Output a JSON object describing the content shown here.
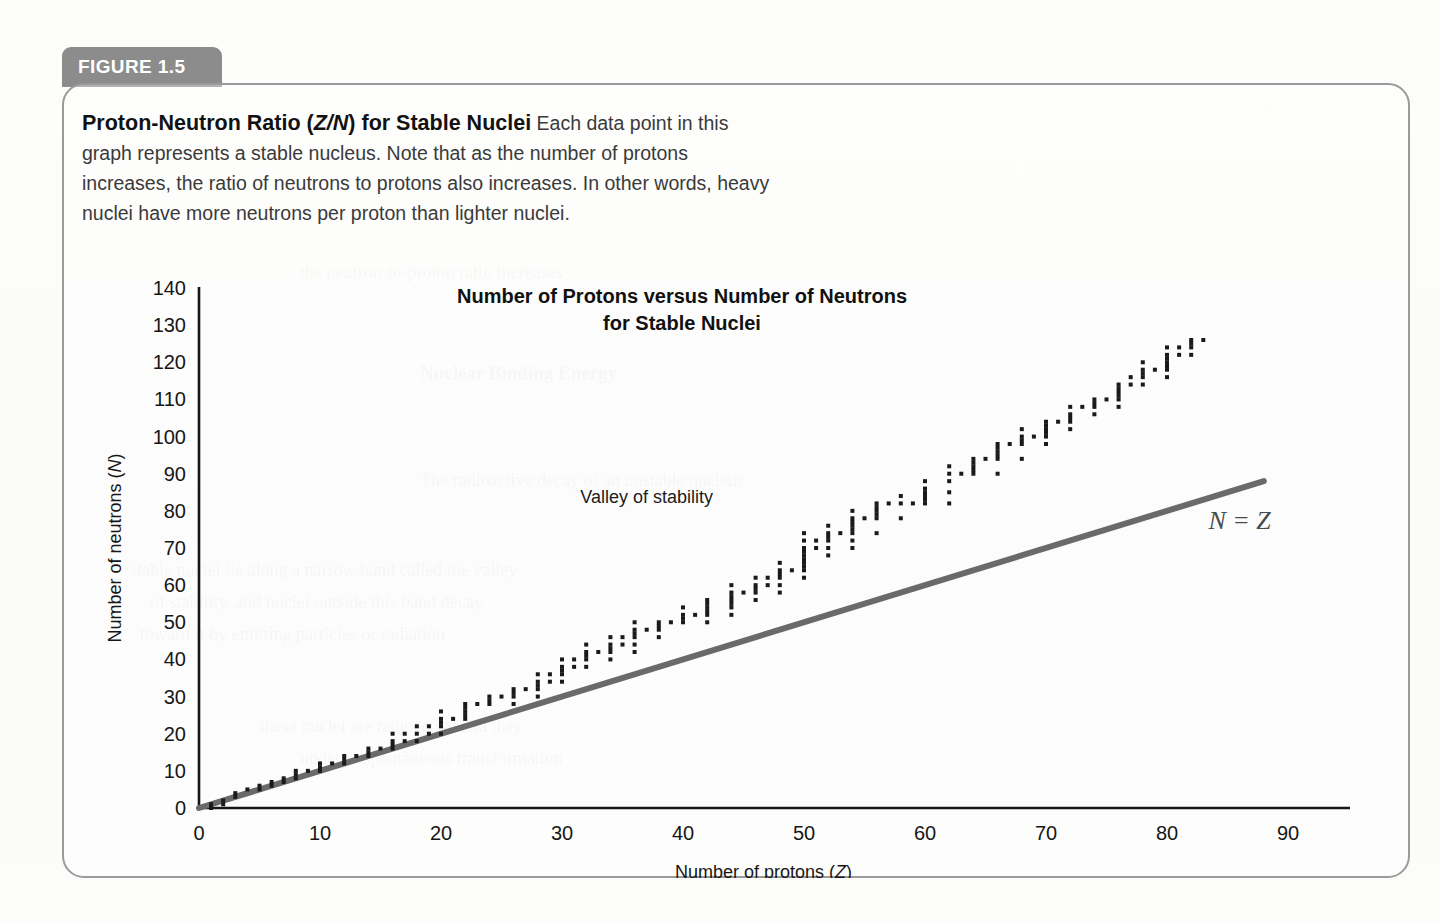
{
  "figure": {
    "tab_label": "FIGURE 1.5",
    "caption_title": "Proton-Neutron Ratio (Z/N) for Stable Nuclei",
    "caption_title_italic_part": "Z/N",
    "caption_body": "Each data point in this graph represents a stable nucleus. Note that as the number of protons increases, the ratio of neutrons to protons also increases. In other words, heavy nuclei have more neutrons per proton than lighter nuclei."
  },
  "colors": {
    "tab_background": "#8c8c8c",
    "tab_text": "#ffffff",
    "box_border": "#9a9a9a",
    "axis": "#161616",
    "data_point": "#1a1a1a",
    "nz_line": "#6a6a6a",
    "page_background": "#fcfcfb"
  },
  "chart_data": {
    "type": "scatter",
    "title": "Number of Protons versus Number of Neutrons for Stable Nuclei",
    "title_line1": "Number of Protons versus Number of Neutrons",
    "title_line2": "for Stable Nuclei",
    "xlabel": "Number of protons (Z)",
    "xlabel_text": "Number of protons (",
    "xlabel_italic": "Z",
    "ylabel": "Number of neutrons (N)",
    "ylabel_text": "Number of neutrons (",
    "ylabel_italic": "N",
    "xlim": [
      0,
      90
    ],
    "ylim": [
      0,
      140
    ],
    "xticks": [
      0,
      10,
      20,
      30,
      40,
      50,
      60,
      70,
      80,
      90
    ],
    "yticks": [
      0,
      10,
      20,
      30,
      40,
      50,
      60,
      70,
      80,
      90,
      100,
      110,
      120,
      130,
      140
    ],
    "grid": false,
    "legend": false,
    "annotations": [
      {
        "text": "Valley of stability",
        "x": 37,
        "y": 82
      },
      {
        "text": "N = Z",
        "x": 86,
        "y": 75
      }
    ],
    "reference_line": {
      "label": "N = Z",
      "equation": "N = Z",
      "from": [
        0,
        0
      ],
      "to": [
        88,
        88
      ],
      "color": "#6a6a6a",
      "width_px": 6
    },
    "series": [
      {
        "name": "Stable nuclei",
        "marker": "square",
        "marker_size_px": 4,
        "color": "#1a1a1a",
        "points_by_Z": [
          {
            "Z": 1,
            "N": [
              0,
              1
            ]
          },
          {
            "Z": 2,
            "N": [
              1,
              2
            ]
          },
          {
            "Z": 3,
            "N": [
              3,
              4
            ]
          },
          {
            "Z": 4,
            "N": [
              5
            ]
          },
          {
            "Z": 5,
            "N": [
              5,
              6
            ]
          },
          {
            "Z": 6,
            "N": [
              6,
              7
            ]
          },
          {
            "Z": 7,
            "N": [
              7,
              8
            ]
          },
          {
            "Z": 8,
            "N": [
              8,
              9,
              10
            ]
          },
          {
            "Z": 9,
            "N": [
              10
            ]
          },
          {
            "Z": 10,
            "N": [
              10,
              11,
              12
            ]
          },
          {
            "Z": 11,
            "N": [
              12
            ]
          },
          {
            "Z": 12,
            "N": [
              12,
              13,
              14
            ]
          },
          {
            "Z": 13,
            "N": [
              14
            ]
          },
          {
            "Z": 14,
            "N": [
              14,
              15,
              16
            ]
          },
          {
            "Z": 15,
            "N": [
              16
            ]
          },
          {
            "Z": 16,
            "N": [
              16,
              17,
              18,
              20
            ]
          },
          {
            "Z": 17,
            "N": [
              18,
              20
            ]
          },
          {
            "Z": 18,
            "N": [
              18,
              20,
              22
            ]
          },
          {
            "Z": 19,
            "N": [
              20,
              22
            ]
          },
          {
            "Z": 20,
            "N": [
              20,
              22,
              23,
              24,
              26
            ]
          },
          {
            "Z": 21,
            "N": [
              24
            ]
          },
          {
            "Z": 22,
            "N": [
              24,
              25,
              26,
              27,
              28
            ]
          },
          {
            "Z": 23,
            "N": [
              28
            ]
          },
          {
            "Z": 24,
            "N": [
              28,
              29,
              30
            ]
          },
          {
            "Z": 25,
            "N": [
              30
            ]
          },
          {
            "Z": 26,
            "N": [
              28,
              30,
              31,
              32
            ]
          },
          {
            "Z": 27,
            "N": [
              32
            ]
          },
          {
            "Z": 28,
            "N": [
              30,
              32,
              33,
              34,
              36
            ]
          },
          {
            "Z": 29,
            "N": [
              34,
              36
            ]
          },
          {
            "Z": 30,
            "N": [
              34,
              36,
              37,
              38,
              40
            ]
          },
          {
            "Z": 31,
            "N": [
              38,
              40
            ]
          },
          {
            "Z": 32,
            "N": [
              38,
              40,
              41,
              42,
              44
            ]
          },
          {
            "Z": 33,
            "N": [
              42
            ]
          },
          {
            "Z": 34,
            "N": [
              40,
              42,
              43,
              44,
              46
            ]
          },
          {
            "Z": 35,
            "N": [
              44,
              46
            ]
          },
          {
            "Z": 36,
            "N": [
              42,
              44,
              46,
              47,
              48,
              50
            ]
          },
          {
            "Z": 37,
            "N": [
              48
            ]
          },
          {
            "Z": 38,
            "N": [
              46,
              48,
              49,
              50
            ]
          },
          {
            "Z": 39,
            "N": [
              50
            ]
          },
          {
            "Z": 40,
            "N": [
              50,
              51,
              52,
              54
            ]
          },
          {
            "Z": 41,
            "N": [
              52
            ]
          },
          {
            "Z": 42,
            "N": [
              50,
              52,
              53,
              54,
              55,
              56
            ]
          },
          {
            "Z": 44,
            "N": [
              52,
              54,
              55,
              56,
              57,
              58,
              60
            ]
          },
          {
            "Z": 45,
            "N": [
              58
            ]
          },
          {
            "Z": 46,
            "N": [
              56,
              58,
              59,
              60,
              62
            ]
          },
          {
            "Z": 47,
            "N": [
              60,
              62
            ]
          },
          {
            "Z": 48,
            "N": [
              58,
              60,
              62,
              63,
              64,
              66
            ]
          },
          {
            "Z": 49,
            "N": [
              64
            ]
          },
          {
            "Z": 50,
            "N": [
              62,
              64,
              65,
              66,
              67,
              68,
              69,
              70,
              72,
              74
            ]
          },
          {
            "Z": 51,
            "N": [
              70,
              72
            ]
          },
          {
            "Z": 52,
            "N": [
              68,
              70,
              72,
              73,
              74,
              76
            ]
          },
          {
            "Z": 53,
            "N": [
              74
            ]
          },
          {
            "Z": 54,
            "N": [
              70,
              72,
              74,
              75,
              76,
              77,
              78,
              80
            ]
          },
          {
            "Z": 55,
            "N": [
              78
            ]
          },
          {
            "Z": 56,
            "N": [
              74,
              78,
              79,
              80,
              81,
              82
            ]
          },
          {
            "Z": 57,
            "N": [
              82
            ]
          },
          {
            "Z": 58,
            "N": [
              78,
              82,
              84
            ]
          },
          {
            "Z": 59,
            "N": [
              82
            ]
          },
          {
            "Z": 60,
            "N": [
              82,
              83,
              84,
              85,
              86,
              88
            ]
          },
          {
            "Z": 62,
            "N": [
              82,
              85,
              88,
              90,
              92
            ]
          },
          {
            "Z": 63,
            "N": [
              90
            ]
          },
          {
            "Z": 64,
            "N": [
              90,
              91,
              92,
              93,
              94
            ]
          },
          {
            "Z": 65,
            "N": [
              94
            ]
          },
          {
            "Z": 66,
            "N": [
              90,
              94,
              95,
              96,
              97,
              98
            ]
          },
          {
            "Z": 67,
            "N": [
              98
            ]
          },
          {
            "Z": 68,
            "N": [
              94,
              98,
              99,
              100,
              102
            ]
          },
          {
            "Z": 69,
            "N": [
              100
            ]
          },
          {
            "Z": 70,
            "N": [
              98,
              100,
              101,
              102,
              103,
              104
            ]
          },
          {
            "Z": 71,
            "N": [
              104
            ]
          },
          {
            "Z": 72,
            "N": [
              102,
              104,
              105,
              106,
              108
            ]
          },
          {
            "Z": 73,
            "N": [
              108
            ]
          },
          {
            "Z": 74,
            "N": [
              106,
              108,
              109,
              110
            ]
          },
          {
            "Z": 75,
            "N": [
              110
            ]
          },
          {
            "Z": 76,
            "N": [
              108,
              110,
              111,
              112,
              113,
              114
            ]
          },
          {
            "Z": 77,
            "N": [
              114,
              116
            ]
          },
          {
            "Z": 78,
            "N": [
              114,
              116,
              117,
              118,
              120
            ]
          },
          {
            "Z": 79,
            "N": [
              118
            ]
          },
          {
            "Z": 80,
            "N": [
              116,
              118,
              119,
              120,
              121,
              122,
              124
            ]
          },
          {
            "Z": 81,
            "N": [
              122,
              124
            ]
          },
          {
            "Z": 82,
            "N": [
              122,
              124,
              125,
              126
            ]
          },
          {
            "Z": 83,
            "N": [
              126
            ]
          }
        ]
      }
    ]
  },
  "ghost_text": {
    "lines": [
      "the neutron-to-proton ratio increases",
      "Nuclear Binding Energy",
      "The radioactive decay of an unstable nucleus",
      "stable nuclei lie along a narrow band called the valley",
      "of stability, and nuclei outside this band decay",
      "toward it by emitting particles or radiation",
      "these nuclei are radioactive and they",
      "undergo spontaneous transformation"
    ]
  }
}
